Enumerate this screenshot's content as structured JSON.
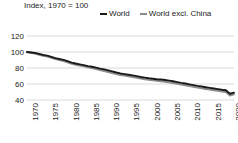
{
  "chart_data": {
    "type": "line",
    "title": "Index, 1970 = 100",
    "xlabel": "",
    "ylabel": "Index, 1970 = 100",
    "ylim": [
      40,
      120
    ],
    "xlim": [
      1970,
      2021
    ],
    "yticks": [
      40,
      60,
      80,
      100,
      120
    ],
    "xticks": [
      1970,
      1975,
      1980,
      1985,
      1990,
      1995,
      2000,
      2005,
      2010,
      2015,
      2020
    ],
    "grid": true,
    "grid_axis": "y",
    "legend_position": "top-right",
    "x": [
      1970,
      1971,
      1972,
      1973,
      1974,
      1975,
      1976,
      1977,
      1978,
      1979,
      1980,
      1981,
      1982,
      1983,
      1984,
      1985,
      1986,
      1987,
      1988,
      1989,
      1990,
      1991,
      1992,
      1993,
      1994,
      1995,
      1996,
      1997,
      1998,
      1999,
      2000,
      2001,
      2002,
      2003,
      2004,
      2005,
      2006,
      2007,
      2008,
      2009,
      2010,
      2011,
      2012,
      2013,
      2014,
      2015,
      2016,
      2017,
      2018,
      2019,
      2020,
      2021
    ],
    "series": [
      {
        "name": "World",
        "color": "#1a1a1a",
        "values": [
          100.0,
          99.4,
          98.8,
          97.6,
          96.2,
          95.4,
          94.0,
          92.4,
          91.2,
          90.2,
          88.6,
          86.8,
          85.6,
          84.6,
          83.6,
          82.4,
          81.6,
          80.4,
          79.2,
          78.2,
          77.0,
          75.8,
          74.4,
          73.2,
          72.4,
          71.6,
          70.8,
          69.8,
          68.8,
          68.0,
          67.2,
          66.6,
          66.0,
          65.6,
          65.0,
          64.2,
          63.4,
          62.4,
          61.4,
          60.6,
          59.6,
          58.6,
          57.6,
          56.8,
          56.0,
          55.2,
          54.4,
          53.6,
          52.8,
          52.2,
          47.8,
          49.2
        ]
      },
      {
        "name": "World excl. China",
        "color": "#8c8c8c",
        "values": [
          100.0,
          99.0,
          98.0,
          96.6,
          95.2,
          94.2,
          92.8,
          91.0,
          89.8,
          88.6,
          87.0,
          85.2,
          84.0,
          83.0,
          82.0,
          80.8,
          79.8,
          78.6,
          77.4,
          76.2,
          75.0,
          73.8,
          72.4,
          71.2,
          70.4,
          69.6,
          68.8,
          67.8,
          66.8,
          66.0,
          65.2,
          64.6,
          64.0,
          63.4,
          62.8,
          62.0,
          61.2,
          60.2,
          59.2,
          58.4,
          57.4,
          56.4,
          55.4,
          54.6,
          53.8,
          53.0,
          52.2,
          51.4,
          50.6,
          50.0,
          45.6,
          47.2
        ]
      }
    ]
  },
  "legend": {
    "entries": [
      {
        "label": "World",
        "color": "#1a1a1a"
      },
      {
        "label": "World excl. China",
        "color": "#8c8c8c"
      }
    ]
  },
  "axis": {
    "title": "Index, 1970 = 100",
    "ytick_labels": [
      "120",
      "100",
      "80",
      "60",
      "40"
    ],
    "xtick_labels": [
      "1970",
      "1975",
      "1980",
      "1985",
      "1990",
      "1995",
      "2000",
      "2005",
      "2010",
      "2015",
      "2020"
    ]
  },
  "colors": {
    "background": "#ffffff",
    "text": "#222222",
    "gridline": "#d9d9d9",
    "series_world": "#1a1a1a",
    "series_world_excl_china": "#8c8c8c"
  }
}
